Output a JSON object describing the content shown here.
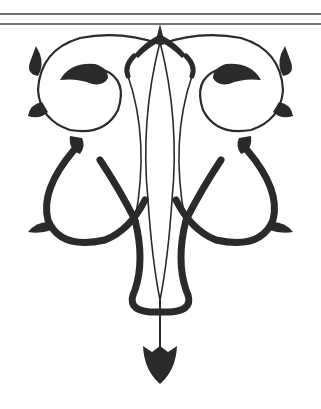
{
  "ornament": {
    "description": "Black and white decorative arabesque ornament below a double horizontal rule",
    "ink_color": "#2a2a2a",
    "background_color": "#ffffff",
    "rules": {
      "count": 2,
      "y_positions": [
        14,
        24
      ]
    }
  }
}
